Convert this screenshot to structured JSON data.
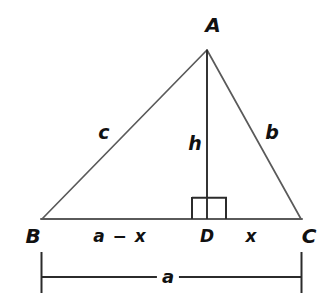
{
  "figure": {
    "type": "geometry-diagram",
    "background_color": "#ffffff",
    "line_color": "#5a5a5a",
    "text_color": "#111111"
  },
  "vertices": {
    "a": "A",
    "b": "B",
    "c": "C",
    "d": "D"
  },
  "sides": {
    "c": "c",
    "b": "b",
    "h": "h"
  },
  "segments": {
    "left": "a − x",
    "right": "x"
  },
  "dimension": {
    "base": "a"
  },
  "markers": {
    "right_angle": "right-angle-square"
  },
  "geometry": {
    "A": [
      207,
      50
    ],
    "B": [
      42,
      219
    ],
    "C": [
      301,
      219
    ],
    "D": [
      207,
      219
    ],
    "right_angle_box": {
      "x": 192,
      "y": 197,
      "w": 35,
      "h": 22
    },
    "dimension_line_y": 277,
    "dimension_tick_top": 252,
    "dimension_tick_bottom": 293
  }
}
